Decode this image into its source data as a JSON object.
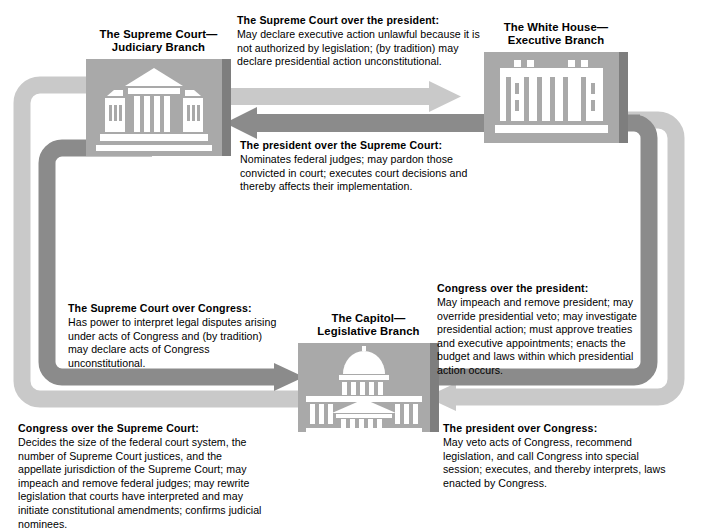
{
  "diagram": {
    "colors": {
      "arrow_light": "#c9c9c9",
      "arrow_dark": "#8b8b8b",
      "building_bg": "#a9a9a9",
      "building_edge": "#7e7e7e",
      "building_icon": "#ffffff",
      "text": "#000000",
      "page_bg": "#ffffff"
    }
  },
  "nodes": [
    {
      "id": "supreme-court",
      "label_line1": "The Supreme Court—",
      "label_line2": "Judiciary Branch",
      "icon": "supreme-court-building-icon"
    },
    {
      "id": "white-house",
      "label_line1": "The White House—",
      "label_line2": "Executive Branch",
      "icon": "white-house-building-icon"
    },
    {
      "id": "capitol",
      "label_line1": "The Capitol—",
      "label_line2": "Legislative Branch",
      "icon": "capitol-building-icon"
    }
  ],
  "callouts": {
    "sc_over_pres": {
      "title": "The Supreme Court over the president:",
      "body": "May declare executive action unlawful because it is not authorized by legislation; (by tradition) may declare presidential action unconstitutional."
    },
    "pres_over_sc": {
      "title": "The president over the Supreme Court:",
      "body": "Nominates federal judges; may pardon those convicted in court; executes court decisions and thereby affects their implementation."
    },
    "congress_over_pres": {
      "title": "Congress over the president:",
      "body": "May impeach and remove president; may override presidential veto; may investigate presidential action; must approve treaties and executive appointments; enacts the budget and laws within which presidential action occurs."
    },
    "sc_over_congress": {
      "title": "The Supreme Court over Congress:",
      "body": "Has power to interpret legal disputes arising under acts of Congress and (by tradition) may declare acts of Congress unconstitutional."
    },
    "congress_over_sc": {
      "title": "Congress over the Supreme Court:",
      "body": "Decides the size of the federal court system, the number of Supreme Court justices, and the appellate jurisdiction of the Supreme Court; may impeach and remove federal judges; may rewrite legislation that courts have interpreted and may initiate constitutional amendments; confirms judicial nominees."
    },
    "pres_over_congress": {
      "title": "The president over Congress:",
      "body": "May veto acts of Congress, recommend legislation, and call Congress into special session; executes, and thereby interprets, laws enacted by Congress."
    }
  },
  "arrows": [
    {
      "id": "arrow-sc-to-president",
      "from": "supreme-court",
      "to": "white-house",
      "direction": "right",
      "tone": "light"
    },
    {
      "id": "arrow-president-to-sc",
      "from": "white-house",
      "to": "supreme-court",
      "direction": "left",
      "tone": "dark"
    },
    {
      "id": "arrow-sc-to-congress",
      "from": "supreme-court",
      "to": "capitol",
      "direction": "right",
      "tone": "dark"
    },
    {
      "id": "arrow-congress-to-sc",
      "from": "capitol",
      "to": "supreme-court",
      "direction": "up-right",
      "tone": "light"
    },
    {
      "id": "arrow-congress-to-president",
      "from": "capitol",
      "to": "white-house",
      "direction": "left-up",
      "tone": "dark"
    },
    {
      "id": "arrow-president-to-congress",
      "from": "white-house",
      "to": "capitol",
      "direction": "left",
      "tone": "light"
    }
  ]
}
